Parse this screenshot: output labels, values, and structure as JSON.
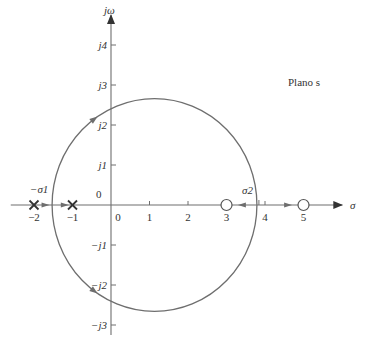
{
  "diagram": {
    "type": "root-locus",
    "plane_label": "Plano s",
    "axes": {
      "real": {
        "label": "σ",
        "range": [
          -2.5,
          5.8
        ],
        "ticks": [
          -2,
          -1,
          0,
          1,
          2,
          3,
          4,
          5
        ],
        "tick_labels": [
          "−2",
          "−1",
          "0",
          "1",
          "2",
          "3",
          "4",
          "5"
        ]
      },
      "imag": {
        "label": "jω",
        "range": [
          -3.3,
          4.6
        ],
        "ticks": [
          4,
          3,
          2,
          1,
          -1,
          -2,
          -3
        ],
        "tick_labels": [
          "j4",
          "j3",
          "j2",
          "j1",
          "−j1",
          "−j2",
          "−j3"
        ]
      },
      "origin_label": "0"
    },
    "poles": [
      {
        "re": -2,
        "im": 0
      },
      {
        "re": -1,
        "im": 0
      }
    ],
    "zeros": [
      {
        "re": 3,
        "im": 0
      },
      {
        "re": 5,
        "im": 0
      }
    ],
    "breakaway": {
      "label": "−σ1",
      "re": -1.53
    },
    "break_in": {
      "label": "σ2",
      "re": 3.79
    },
    "locus_circle": {
      "center_re": 1.13,
      "radius": 2.66
    },
    "colors": {
      "line": "#6e6e6e",
      "text": "#333333"
    }
  }
}
